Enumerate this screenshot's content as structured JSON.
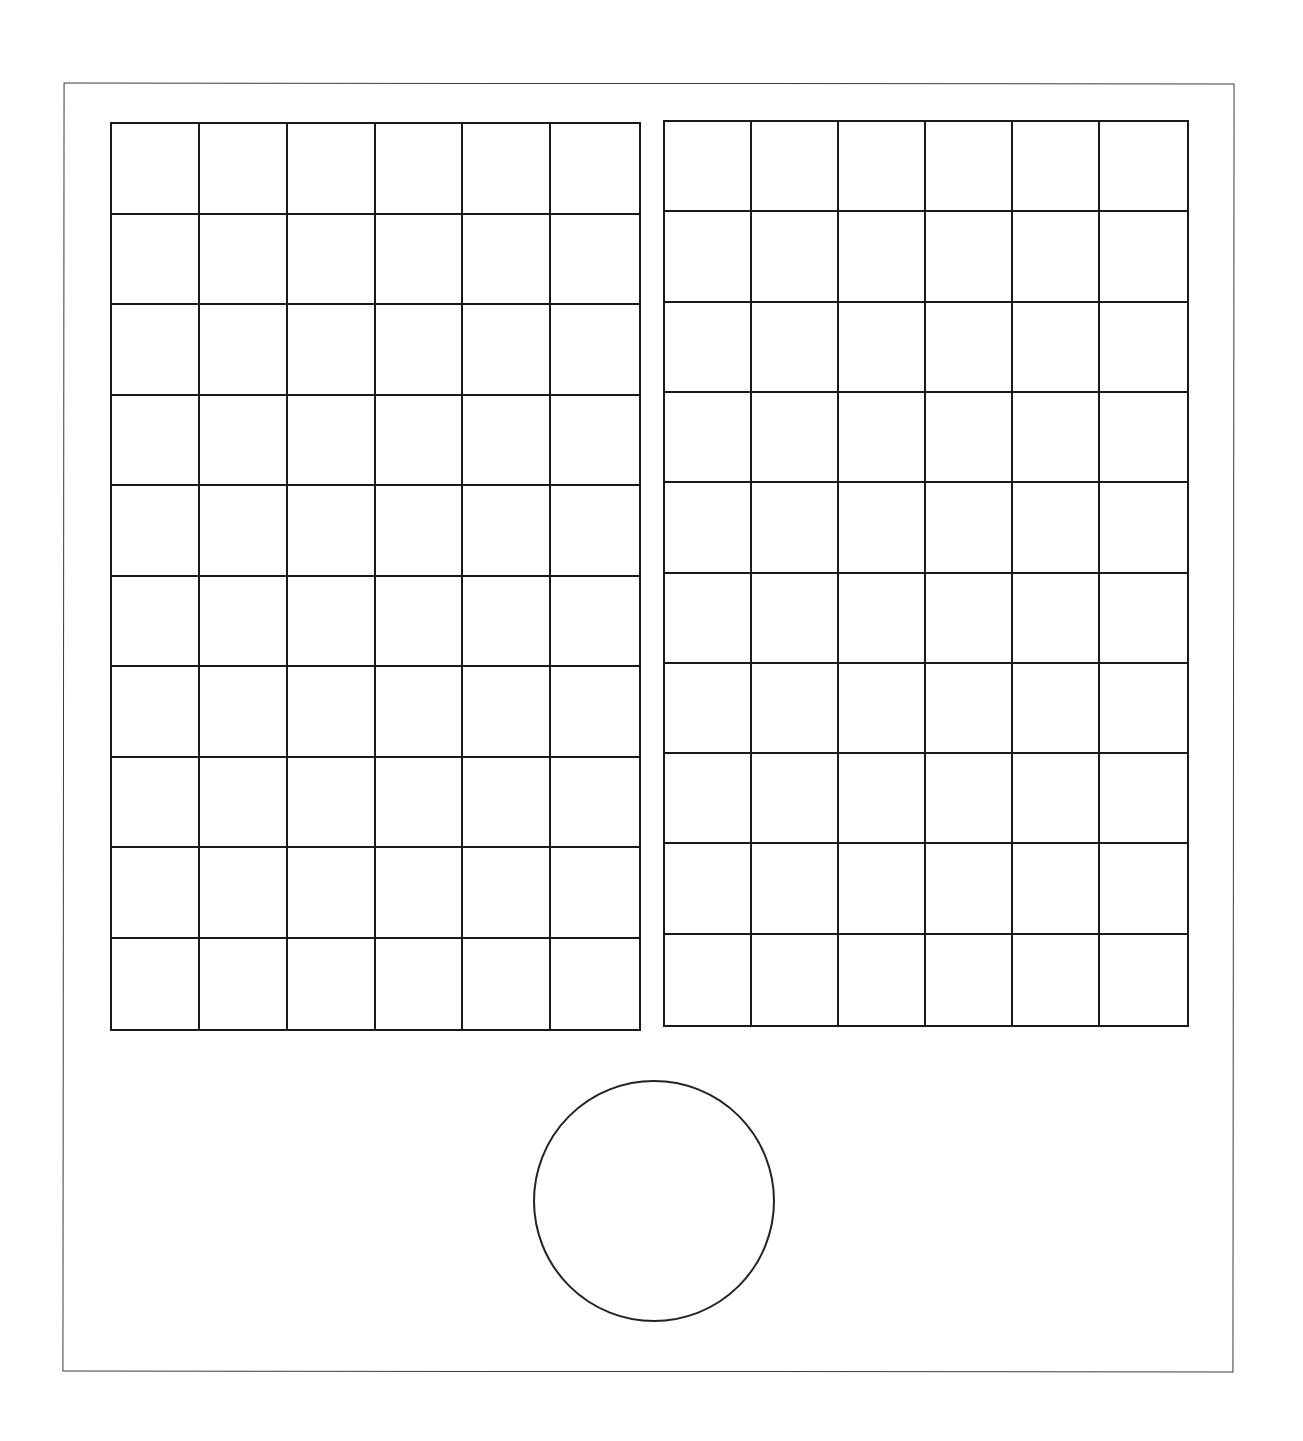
{
  "diagram": {
    "stroke_color": "#1a1a1a",
    "background_color": "#ffffff",
    "frame": {
      "x": 63,
      "y": 83,
      "width": 1171,
      "height": 1289
    },
    "grids": [
      {
        "id": "left-grid",
        "x": 110,
        "y": 122,
        "width": 531,
        "height": 909,
        "columns": 6,
        "rows": 10
      },
      {
        "id": "right-grid",
        "x": 663,
        "y": 120,
        "width": 526,
        "height": 907,
        "columns": 6,
        "rows": 10
      }
    ],
    "circle": {
      "cx": 654,
      "cy": 1201,
      "r": 121
    }
  }
}
